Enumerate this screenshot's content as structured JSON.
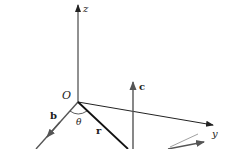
{
  "diagram": {
    "type": "3d-vector-diagram",
    "colors": {
      "axis": "#222222",
      "vector_gray": "#555555",
      "vector_r": "#111111",
      "background": "#ffffff"
    },
    "labels": {
      "origin": "O",
      "z_axis": "z",
      "y_axis": "y",
      "vector_b": "b",
      "vector_r": "r",
      "vector_c": "c",
      "angle": "θ"
    }
  }
}
